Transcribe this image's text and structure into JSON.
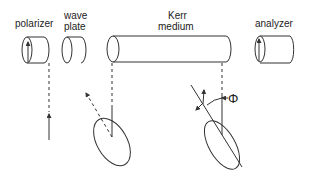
{
  "diagram": {
    "components": [
      {
        "id": "polarizer",
        "label": "polarizer"
      },
      {
        "id": "wave-plate",
        "label_line1": "wave",
        "label_line2": "plate"
      },
      {
        "id": "kerr-medium",
        "label_line1": "Kerr",
        "label_line2": "medium"
      },
      {
        "id": "analyzer",
        "label": "analyzer"
      }
    ],
    "angle_symbol": "Φ",
    "colors": {
      "line": "#333333",
      "background": "#ffffff"
    }
  }
}
